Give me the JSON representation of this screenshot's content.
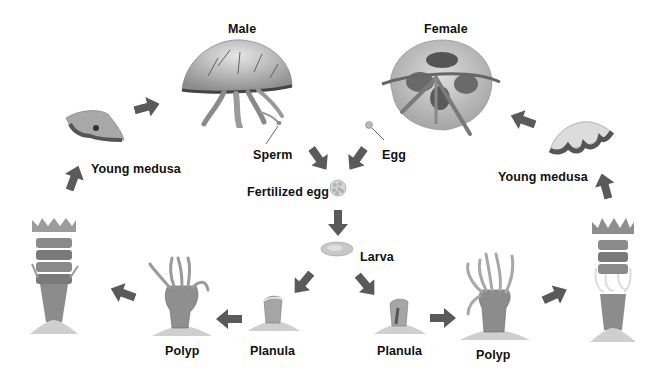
{
  "diagram": {
    "labels": {
      "male": "Male",
      "female": "Female",
      "sperm": "Sperm",
      "egg": "Egg",
      "fertilized_egg": "Fertilized egg",
      "larva": "Larva",
      "planula_left": "Planula",
      "planula_right": "Planula",
      "polyp_left": "Polyp",
      "polyp_right": "Polyp",
      "young_medusa_left": "Young medusa",
      "young_medusa_right": "Young medusa"
    },
    "stages_left_branch": [
      "Larva",
      "Planula",
      "Polyp",
      "Strobila",
      "Young medusa",
      "Male"
    ],
    "stages_right_branch": [
      "Larva",
      "Planula",
      "Polyp",
      "Strobila",
      "Young medusa",
      "Female"
    ],
    "center_flow": [
      "Sperm",
      "Egg",
      "Fertilized egg",
      "Larva"
    ],
    "colors": {
      "arrow": "#5a5a5a",
      "text": "#111111",
      "background": "#ffffff",
      "illustration_gray": "#9a9a9a"
    }
  }
}
